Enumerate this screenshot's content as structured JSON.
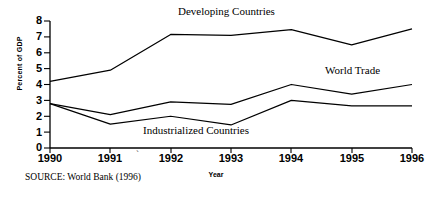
{
  "chart_data": {
    "type": "line",
    "title": "",
    "xlabel": "Year",
    "ylabel": "Percent of GDP",
    "categories": [
      "1990",
      "1991",
      "1992",
      "1993",
      "1994",
      "1995",
      "1996"
    ],
    "x": [
      1990,
      1991,
      1992,
      1993,
      1994,
      1995,
      1996
    ],
    "xlim": [
      1990,
      1996
    ],
    "ylim": [
      0,
      8
    ],
    "y_ticks": [
      "8",
      "7",
      "6",
      "5",
      "4",
      "3",
      "2",
      "1",
      "0"
    ],
    "grid": false,
    "legend_position": "inline-annotations",
    "series": [
      {
        "name": "Developing Countries",
        "values": [
          4.2,
          4.9,
          7.15,
          7.1,
          7.45,
          6.5,
          7.5
        ],
        "color": "#000000"
      },
      {
        "name": "World Trade",
        "values": [
          2.8,
          2.1,
          2.9,
          2.75,
          4.0,
          3.4,
          4.0
        ],
        "color": "#000000"
      },
      {
        "name": "Industrialized Countries",
        "values": [
          2.8,
          1.5,
          2.0,
          1.45,
          3.0,
          2.65,
          2.65
        ],
        "color": "#000000"
      }
    ],
    "annotations": [
      {
        "text": "Developing Countries",
        "series": "Developing Countries"
      },
      {
        "text": "World Trade",
        "series": "World Trade"
      },
      {
        "text": "Industrialized Countries",
        "series": "Industrialized Countries"
      }
    ],
    "source_note": "SOURCE:  World Bank (1996)",
    "axis_color": "#000000",
    "background": "#ffffff"
  },
  "figure": {
    "y_axis_title": "Percent of GDP",
    "x_axis_title": "Year",
    "source": "SOURCE:  World Bank (1996)",
    "labels": {
      "developing": "Developing Countries",
      "world_trade": "World Trade",
      "industrialized": "Industrialized Countries"
    },
    "y_ticks": {
      "t0": "8",
      "t1": "7",
      "t2": "6",
      "t3": "5",
      "t4": "4",
      "t5": "3",
      "t6": "2",
      "t7": "1",
      "t8": "0"
    },
    "x_ticks": {
      "t0": "1990",
      "t1": "1991",
      "t2": "1992",
      "t3": "1993",
      "t4": "1994",
      "t5": "1995",
      "t6": "1996"
    },
    "artifact": "`"
  }
}
